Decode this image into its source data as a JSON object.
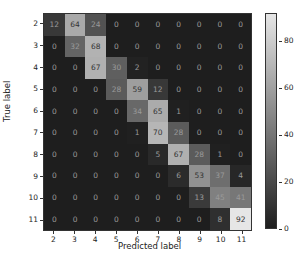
{
  "chart_data": {
    "type": "heatmap",
    "title": "",
    "xlabel": "Predicted label",
    "ylabel": "True label",
    "x_categories": [
      "2",
      "3",
      "4",
      "5",
      "6",
      "7",
      "8",
      "9",
      "10",
      "11"
    ],
    "y_categories": [
      "2",
      "3",
      "4",
      "5",
      "6",
      "7",
      "8",
      "9",
      "10",
      "11"
    ],
    "values": [
      [
        12,
        64,
        24,
        0,
        0,
        0,
        0,
        0,
        0,
        0
      ],
      [
        0,
        32,
        68,
        0,
        0,
        0,
        0,
        0,
        0,
        0
      ],
      [
        0,
        0,
        67,
        30,
        2,
        0,
        0,
        0,
        0,
        0
      ],
      [
        0,
        0,
        0,
        28,
        59,
        12,
        0,
        0,
        0,
        0
      ],
      [
        0,
        0,
        0,
        0,
        34,
        65,
        1,
        0,
        0,
        0
      ],
      [
        0,
        0,
        0,
        0,
        1,
        70,
        28,
        0,
        0,
        0
      ],
      [
        0,
        0,
        0,
        0,
        0,
        5,
        67,
        28,
        1,
        0
      ],
      [
        0,
        0,
        0,
        0,
        0,
        0,
        6,
        53,
        37,
        4
      ],
      [
        0,
        0,
        0,
        0,
        0,
        0,
        0,
        13,
        45,
        41
      ],
      [
        0,
        0,
        0,
        0,
        0,
        0,
        0,
        0,
        8,
        92
      ]
    ],
    "colormap": "gray",
    "colorbar": {
      "min": 0,
      "max": 92,
      "ticks": [
        0,
        20,
        40,
        60,
        80
      ]
    },
    "grid": false,
    "legend": "colorbar-right"
  }
}
